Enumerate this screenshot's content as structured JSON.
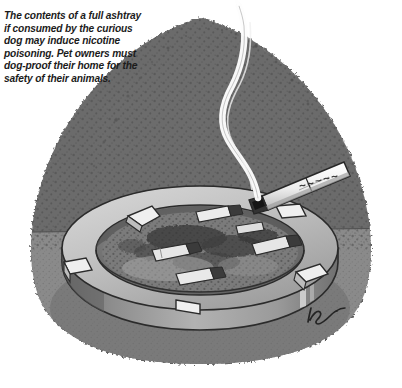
{
  "illustration": {
    "title": "Ashtray with cigarette butts and rising smoke",
    "style": "black-and-white stippled pen-and-ink cartoon illustration",
    "caption": {
      "lines": [
        "The contents of a full ashtray",
        "if consumed by the curious",
        "dog may induce nicotine",
        "poisoning. Pet owners must",
        "dog-proof their home for the",
        "safety of their animals."
      ],
      "full_text": "The contents of a full ashtray if consumed by the curious dog may induce nicotine poisoning. Pet owners must dog-proof their home for the safety of their animals."
    },
    "signature": {
      "present": true,
      "text": "illegible cursive artist signature",
      "position": "bottom-right"
    },
    "objects": {
      "ashtray_label": "round ashtray",
      "cigarette_label": "lit cigarette resting on rim",
      "cigarette_brand_text": "illegible brand lettering",
      "smoke_label": "rising smoke wisp",
      "butts_label": "crushed cigarette butts",
      "ash_label": "ash and debris",
      "background_label": "stippled shadow background"
    },
    "colors": {
      "page": "#ffffff",
      "background_upper": "#6e6e6e",
      "background_lower": "#8a8a8a",
      "stipple_dark": "#5a5a5a",
      "stipple_darkest": "#3a3a3a",
      "ashtray_rim_light": "#cfcfcf",
      "ashtray_rim_mid": "#a8a8a8",
      "ashtray_body": "#9a9a9a",
      "ashtray_body_shadow": "#6a6a6a",
      "ash_bed": "#7c7c7c",
      "ash_dark": "#3d3d3d",
      "butt_white": "#e8e8e8",
      "cigarette_white": "#f2f2f2",
      "smoke_white": "#fdfdfd",
      "outline": "#262626",
      "caption_text": "#1b1b1b"
    }
  }
}
